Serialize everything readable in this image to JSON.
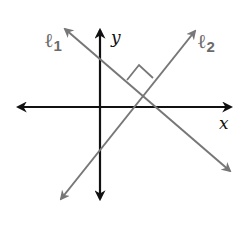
{
  "diagram": {
    "type": "coordinate-plane-perpendicular-lines",
    "axes": {
      "x_label": "x",
      "y_label": "y"
    },
    "lines": [
      {
        "id": "l1",
        "symbol": "ℓ",
        "subscript": "1",
        "color": "#777777",
        "slope": "negative"
      },
      {
        "id": "l2",
        "symbol": "ℓ",
        "subscript": "2",
        "color": "#777777",
        "slope": "positive"
      }
    ],
    "right_angle_marker": true,
    "colors": {
      "axis": "#111111",
      "line": "#777777",
      "background": "#ffffff"
    }
  }
}
